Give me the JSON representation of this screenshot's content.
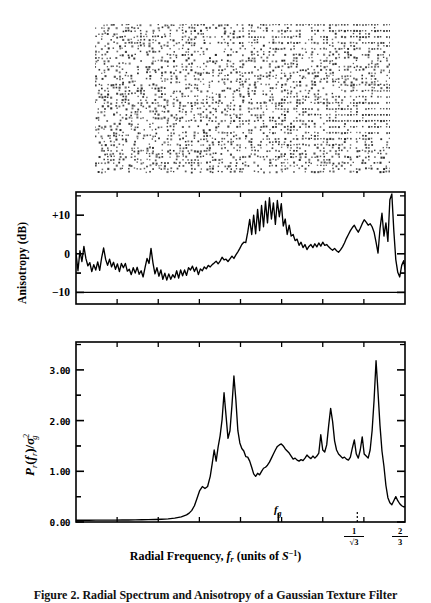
{
  "figure": {
    "texture": {
      "name": "texture-stimulus",
      "description": "dot-pattern texture stimulus"
    },
    "caption": "Figure 2. Radial Spectrum and Anisotropy of a Gaussian Texture Filter"
  },
  "xaxis": {
    "label_main": "Radial Frequency,",
    "label_var": "f",
    "label_var_sub": "r",
    "label_units_open": "(units of",
    "label_units_var": "S",
    "label_units_exp": "−1",
    "label_units_close": ")",
    "markers": [
      {
        "name": "fg",
        "text": "f",
        "sub": "g",
        "x_frac": 0.615
      },
      {
        "name": "inv-sqrt3",
        "num": "1",
        "den": "√3",
        "x_frac": 0.855
      },
      {
        "name": "two-thirds",
        "num": "2",
        "den": "3",
        "x_frac": 0.975
      }
    ]
  },
  "chart_data": [
    {
      "type": "line",
      "name": "anisotropy",
      "title": "",
      "ylabel": "Anisotropy (dB)",
      "xlabel": "Radial Frequency, f_r (units of S^-1)",
      "yticklabels": [
        "+10",
        "0",
        "−10"
      ],
      "ytickvalues": [
        10,
        0,
        -10
      ],
      "ylim": [
        -13,
        16
      ],
      "xlim": [
        0,
        1
      ],
      "grid": false,
      "legend": null,
      "hline_value": -10,
      "x": [
        0.0,
        0.006,
        0.012,
        0.018,
        0.024,
        0.03,
        0.036,
        0.042,
        0.048,
        0.054,
        0.06,
        0.066,
        0.072,
        0.078,
        0.084,
        0.09,
        0.096,
        0.102,
        0.108,
        0.114,
        0.12,
        0.126,
        0.132,
        0.138,
        0.144,
        0.15,
        0.156,
        0.162,
        0.168,
        0.174,
        0.18,
        0.186,
        0.192,
        0.198,
        0.204,
        0.21,
        0.216,
        0.222,
        0.228,
        0.234,
        0.24,
        0.246,
        0.252,
        0.258,
        0.264,
        0.27,
        0.276,
        0.282,
        0.288,
        0.294,
        0.3,
        0.306,
        0.312,
        0.318,
        0.324,
        0.33,
        0.336,
        0.342,
        0.348,
        0.354,
        0.36,
        0.366,
        0.372,
        0.378,
        0.384,
        0.39,
        0.396,
        0.402,
        0.408,
        0.414,
        0.42,
        0.426,
        0.432,
        0.438,
        0.444,
        0.45,
        0.456,
        0.462,
        0.468,
        0.474,
        0.48,
        0.486,
        0.492,
        0.498,
        0.504,
        0.51,
        0.516,
        0.522,
        0.528,
        0.534,
        0.54,
        0.546,
        0.552,
        0.558,
        0.564,
        0.57,
        0.576,
        0.582,
        0.588,
        0.594,
        0.6,
        0.606,
        0.612,
        0.618,
        0.624,
        0.63,
        0.636,
        0.642,
        0.648,
        0.654,
        0.66,
        0.666,
        0.672,
        0.678,
        0.684,
        0.69,
        0.696,
        0.702,
        0.708,
        0.714,
        0.72,
        0.726,
        0.732,
        0.738,
        0.744,
        0.75,
        0.756,
        0.762,
        0.768,
        0.774,
        0.78,
        0.786,
        0.792,
        0.798,
        0.804,
        0.81,
        0.816,
        0.822,
        0.828,
        0.834,
        0.84,
        0.846,
        0.852,
        0.858,
        0.864,
        0.87,
        0.876,
        0.882,
        0.888,
        0.894,
        0.9,
        0.906,
        0.912,
        0.918,
        0.924,
        0.93,
        0.936,
        0.942,
        0.948,
        0.954,
        0.96,
        0.966,
        0.972,
        0.978,
        0.984,
        0.99,
        0.996,
        1.0
      ],
      "values": [
        0.2,
        -4.4,
        0.8,
        -2.0,
        1.9,
        -1.2,
        -3.1,
        -2.3,
        -4.6,
        -2.8,
        -4.2,
        -2.1,
        -4.3,
        -1.0,
        1.5,
        -1.4,
        -3.0,
        -1.4,
        -3.4,
        -2.2,
        -4.0,
        -2.6,
        -4.6,
        -2.5,
        -3.6,
        -2.5,
        -4.5,
        -4.0,
        -5.4,
        -3.6,
        -5.0,
        -3.5,
        -5.3,
        -4.4,
        -6.0,
        -3.5,
        -1.2,
        -2.5,
        1.4,
        -2.4,
        -5.2,
        -3.6,
        -5.8,
        -4.2,
        -6.6,
        -5.0,
        -6.8,
        -5.2,
        -6.6,
        -5.4,
        -6.2,
        -4.4,
        -6.3,
        -4.2,
        -5.7,
        -4.2,
        -5.6,
        -3.6,
        -4.2,
        -3.2,
        -4.6,
        -3.5,
        -5.4,
        -3.9,
        -4.4,
        -3.4,
        -3.9,
        -3.0,
        -3.4,
        -2.8,
        -2.4,
        -1.9,
        -2.6,
        -1.9,
        -0.9,
        -1.6,
        -1.4,
        -2.0,
        -1.3,
        -0.6,
        -1.2,
        -0.3,
        0.5,
        1.4,
        2.4,
        3.0,
        2.9,
        5.6,
        8.9,
        5.0,
        10.0,
        5.2,
        11.5,
        6.0,
        12.5,
        7.0,
        13.6,
        8.0,
        14.5,
        9.0,
        13.2,
        7.6,
        13.8,
        9.6,
        13.0,
        7.2,
        9.0,
        5.0,
        7.4,
        4.6,
        5.0,
        3.4,
        3.8,
        2.2,
        3.0,
        1.6,
        2.4,
        1.1,
        1.9,
        2.4,
        1.6,
        2.6,
        1.8,
        2.8,
        2.0,
        3.0,
        2.2,
        2.4,
        1.8,
        1.3,
        0.9,
        1.4,
        0.8,
        0.4,
        1.0,
        1.8,
        2.8,
        4.0,
        5.0,
        6.0,
        6.8,
        7.4,
        6.4,
        5.6,
        6.6,
        7.8,
        8.8,
        8.2,
        7.4,
        7.8,
        7.0,
        5.6,
        3.0,
        0.2,
        6.5,
        10.5,
        4.6,
        8.0,
        3.2,
        14.0,
        15.5,
        6.0,
        -1.5,
        -4.8,
        -6.0,
        -3.0,
        -1.8,
        -4.0,
        -5.4,
        -6.0,
        -5.6,
        -6.2,
        -5.8,
        -7.0,
        -8.0,
        -8.6,
        -8.2,
        -7.8
      ]
    },
    {
      "type": "line",
      "name": "radial-power-spectrum",
      "title": "",
      "ylabel": "P_r(f_r)/sigma_g^2",
      "xlabel": "Radial Frequency, f_r (units of S^-1)",
      "yticklabels": [
        "3.00",
        "2.00",
        "1.00",
        "0.00"
      ],
      "ytickvalues": [
        3.0,
        2.0,
        1.0,
        0.0
      ],
      "ylim": [
        0.0,
        3.55
      ],
      "xlim": [
        0,
        1
      ],
      "grid": false,
      "legend": null,
      "x": [
        0.0,
        0.02,
        0.04,
        0.06,
        0.08,
        0.1,
        0.12,
        0.14,
        0.16,
        0.18,
        0.2,
        0.22,
        0.24,
        0.26,
        0.28,
        0.3,
        0.32,
        0.336,
        0.344,
        0.352,
        0.36,
        0.368,
        0.376,
        0.384,
        0.392,
        0.4,
        0.408,
        0.414,
        0.42,
        0.426,
        0.432,
        0.438,
        0.444,
        0.45,
        0.456,
        0.462,
        0.468,
        0.474,
        0.48,
        0.486,
        0.492,
        0.498,
        0.504,
        0.51,
        0.516,
        0.522,
        0.528,
        0.534,
        0.54,
        0.546,
        0.552,
        0.558,
        0.564,
        0.57,
        0.576,
        0.582,
        0.588,
        0.594,
        0.6,
        0.606,
        0.612,
        0.618,
        0.624,
        0.63,
        0.636,
        0.642,
        0.648,
        0.654,
        0.66,
        0.666,
        0.672,
        0.678,
        0.684,
        0.69,
        0.696,
        0.702,
        0.708,
        0.714,
        0.72,
        0.726,
        0.732,
        0.738,
        0.744,
        0.75,
        0.756,
        0.762,
        0.768,
        0.774,
        0.78,
        0.786,
        0.792,
        0.798,
        0.804,
        0.81,
        0.816,
        0.822,
        0.828,
        0.834,
        0.84,
        0.846,
        0.852,
        0.858,
        0.864,
        0.87,
        0.876,
        0.882,
        0.888,
        0.894,
        0.9,
        0.906,
        0.912,
        0.918,
        0.924,
        0.93,
        0.936,
        0.942,
        0.948,
        0.954,
        0.96,
        0.966,
        0.972,
        0.978,
        0.984,
        0.99,
        0.996,
        1.0
      ],
      "values": [
        0.035,
        0.035,
        0.035,
        0.036,
        0.036,
        0.037,
        0.038,
        0.039,
        0.04,
        0.042,
        0.044,
        0.047,
        0.05,
        0.055,
        0.062,
        0.075,
        0.1,
        0.14,
        0.175,
        0.23,
        0.32,
        0.47,
        0.62,
        0.7,
        0.66,
        0.7,
        0.9,
        1.15,
        1.42,
        1.2,
        1.48,
        1.7,
        2.02,
        2.55,
        2.1,
        1.65,
        1.8,
        2.3,
        2.88,
        2.4,
        1.8,
        1.56,
        1.45,
        1.4,
        1.29,
        1.28,
        1.2,
        1.08,
        0.95,
        0.9,
        0.96,
        0.93,
        1.0,
        1.06,
        1.08,
        1.12,
        1.18,
        1.26,
        1.34,
        1.42,
        1.49,
        1.52,
        1.54,
        1.5,
        1.44,
        1.4,
        1.36,
        1.3,
        1.24,
        1.26,
        1.22,
        1.2,
        1.23,
        1.21,
        1.26,
        1.32,
        1.28,
        1.25,
        1.3,
        1.26,
        1.3,
        1.36,
        1.72,
        1.42,
        1.38,
        1.52,
        1.9,
        2.24,
        1.98,
        1.6,
        1.42,
        1.34,
        1.3,
        1.26,
        1.28,
        1.24,
        1.22,
        1.28,
        1.46,
        1.62,
        1.34,
        1.26,
        1.42,
        1.68,
        1.34,
        1.3,
        1.26,
        1.42,
        1.8,
        2.4,
        3.18,
        2.56,
        1.9,
        1.4,
        1.1,
        0.72,
        0.48,
        0.38,
        0.34,
        0.42,
        0.5,
        0.42,
        0.36,
        0.32,
        0.3,
        0.3
      ]
    }
  ]
}
